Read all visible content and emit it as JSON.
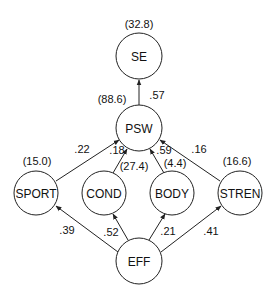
{
  "diagram": {
    "type": "path-diagram",
    "nodes": [
      {
        "id": "SE",
        "label": "SE",
        "variance": "(32.8)"
      },
      {
        "id": "PSW",
        "label": "PSW",
        "variance": "(88.6)"
      },
      {
        "id": "SPORT",
        "label": "SPORT",
        "variance": "(15.0)"
      },
      {
        "id": "COND",
        "label": "COND",
        "variance": "(27.4)"
      },
      {
        "id": "BODY",
        "label": "BODY",
        "variance": "(4.4)"
      },
      {
        "id": "STREN",
        "label": "STREN",
        "variance": "(16.6)"
      },
      {
        "id": "EFF",
        "label": "EFF"
      }
    ],
    "edges": [
      {
        "from": "PSW",
        "to": "SE",
        "coef": ".57"
      },
      {
        "from": "SPORT",
        "to": "PSW",
        "coef": ".22"
      },
      {
        "from": "COND",
        "to": "PSW",
        "coef": ".18"
      },
      {
        "from": "BODY",
        "to": "PSW",
        "coef": ".59"
      },
      {
        "from": "STREN",
        "to": "PSW",
        "coef": ".16"
      },
      {
        "from": "EFF",
        "to": "SPORT",
        "coef": ".39"
      },
      {
        "from": "EFF",
        "to": "COND",
        "coef": ".52"
      },
      {
        "from": "EFF",
        "to": "BODY",
        "coef": ".21"
      },
      {
        "from": "EFF",
        "to": "STREN",
        "coef": ".41"
      }
    ]
  }
}
